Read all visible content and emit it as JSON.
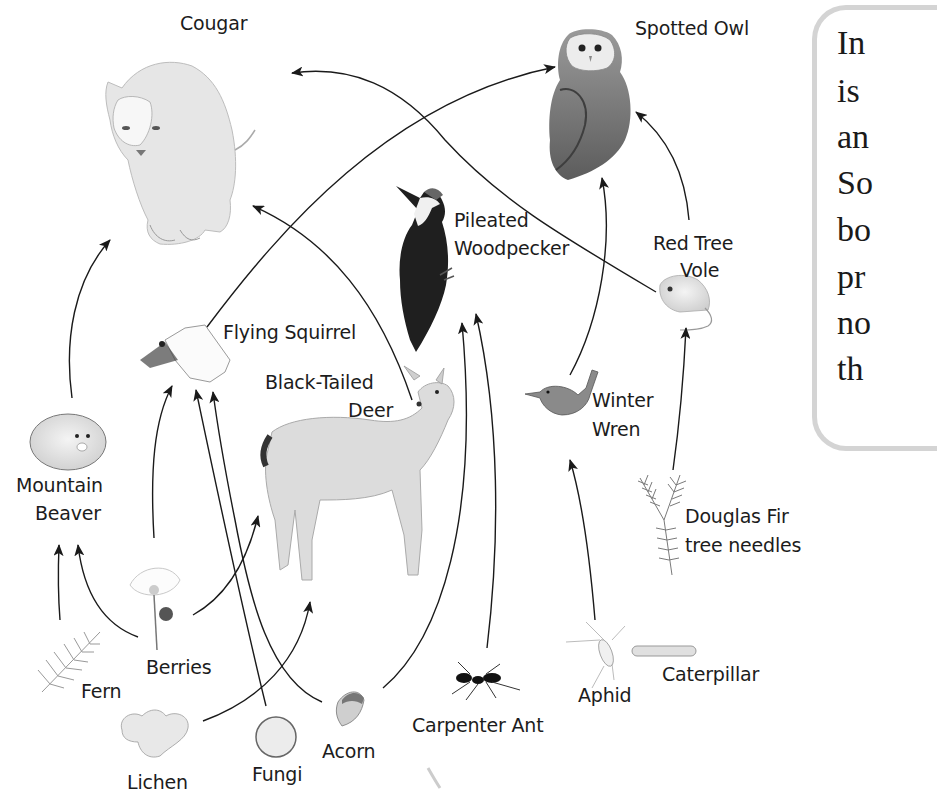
{
  "diagram": {
    "type": "food-web",
    "organisms": [
      {
        "id": "cougar",
        "label": "Cougar"
      },
      {
        "id": "spotted_owl",
        "label": "Spotted Owl"
      },
      {
        "id": "woodpecker",
        "label_lines": [
          "Pileated",
          "Woodpecker"
        ]
      },
      {
        "id": "red_tree_vole",
        "label_lines": [
          "Red Tree",
          "Vole"
        ]
      },
      {
        "id": "flying_squirrel",
        "label": "Flying Squirrel"
      },
      {
        "id": "deer",
        "label_lines": [
          "Black-Tailed",
          "Deer"
        ]
      },
      {
        "id": "mountain_beaver",
        "label_lines": [
          "Mountain",
          "Beaver"
        ]
      },
      {
        "id": "winter_wren",
        "label_lines": [
          "Winter",
          "Wren"
        ]
      },
      {
        "id": "douglas_fir",
        "label_lines": [
          "Douglas Fir",
          "tree needles"
        ]
      },
      {
        "id": "berries",
        "label": "Berries"
      },
      {
        "id": "fern",
        "label": "Fern"
      },
      {
        "id": "lichen",
        "label": "Lichen"
      },
      {
        "id": "fungi",
        "label": "Fungi"
      },
      {
        "id": "acorn",
        "label": "Acorn"
      },
      {
        "id": "carpenter_ant",
        "label": "Carpenter Ant"
      },
      {
        "id": "aphid",
        "label": "Aphid"
      },
      {
        "id": "caterpillar",
        "label": "Caterpillar"
      }
    ],
    "edges": [
      {
        "from": "mountain_beaver",
        "to": "cougar"
      },
      {
        "from": "flying_squirrel",
        "to": "spotted_owl"
      },
      {
        "from": "deer",
        "to": "cougar"
      },
      {
        "from": "red_tree_vole",
        "to": "cougar"
      },
      {
        "from": "berries",
        "to": "flying_squirrel"
      },
      {
        "from": "berries",
        "to": "mountain_beaver"
      },
      {
        "from": "fern",
        "to": "mountain_beaver"
      },
      {
        "from": "berries",
        "to": "deer"
      },
      {
        "from": "lichen",
        "to": "deer"
      },
      {
        "from": "fungi",
        "to": "flying_squirrel"
      },
      {
        "from": "acorn",
        "to": "flying_squirrel"
      },
      {
        "from": "acorn",
        "to": "woodpecker"
      },
      {
        "from": "carpenter_ant",
        "to": "woodpecker"
      },
      {
        "from": "winter_wren",
        "to": "spotted_owl"
      },
      {
        "from": "aphid",
        "to": "winter_wren"
      },
      {
        "from": "douglas_fir",
        "to": "red_tree_vole"
      },
      {
        "from": "red_tree_vole",
        "to": "spotted_owl"
      }
    ]
  },
  "labels": {
    "cougar": "Cougar",
    "spotted_owl": "Spotted Owl",
    "woodpecker_1": "Pileated",
    "woodpecker_2": "Woodpecker",
    "vole_1": "Red Tree",
    "vole_2": "Vole",
    "flying_squirrel": "Flying Squirrel",
    "deer_1": "Black-Tailed",
    "deer_2": "Deer",
    "beaver_1": "Mountain",
    "beaver_2": "Beaver",
    "wren_1": "Winter",
    "wren_2": "Wren",
    "fir_1": "Douglas Fir",
    "fir_2": "tree needles",
    "berries": "Berries",
    "fern": "Fern",
    "lichen": "Lichen",
    "fungi": "Fungi",
    "acorn": "Acorn",
    "carpenter_ant": "Carpenter Ant",
    "aphid": "Aphid",
    "caterpillar": "Caterpillar"
  },
  "sidebar_text": {
    "lines": [
      "In",
      "is",
      "an",
      "So",
      "bo",
      "pr",
      "no",
      "th"
    ]
  },
  "colors": {
    "arrow": "#1a1a1a",
    "box_border": "#d4d4d4"
  }
}
